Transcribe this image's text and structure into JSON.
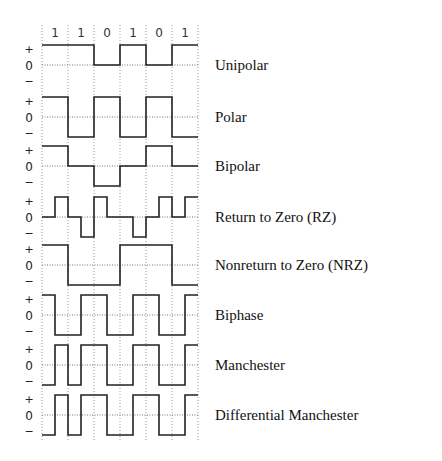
{
  "bits": [
    "1",
    "1",
    "0",
    "1",
    "0",
    "1"
  ],
  "axis_symbols": {
    "plus": "+",
    "zero": "0",
    "minus": "−"
  },
  "colors": {
    "wave": "#222222",
    "grid": "#9a9a9a",
    "text": "#111111"
  },
  "encodings": [
    {
      "name": "Unipolar",
      "half_bit_levels": [
        1,
        1,
        1,
        1,
        0,
        0,
        1,
        1,
        0,
        0,
        1,
        1
      ]
    },
    {
      "name": "Polar",
      "half_bit_levels": [
        1,
        1,
        -1,
        -1,
        1,
        1,
        -1,
        -1,
        1,
        1,
        -1,
        -1
      ]
    },
    {
      "name": "Bipolar",
      "half_bit_levels": [
        1,
        1,
        0,
        0,
        -1,
        -1,
        0,
        0,
        1,
        1,
        0,
        0
      ]
    },
    {
      "name": "Return to Zero (RZ)",
      "half_bit_levels": [
        0,
        1,
        0,
        -1,
        1,
        0,
        0,
        -1,
        0,
        1,
        0,
        1
      ]
    },
    {
      "name": "Nonreturn to Zero (NRZ)",
      "half_bit_levels": [
        1,
        1,
        -1,
        -1,
        -1,
        -1,
        1,
        1,
        1,
        1,
        -1,
        -1
      ]
    },
    {
      "name": "Biphase",
      "half_bit_levels": [
        1,
        -1,
        -1,
        1,
        1,
        -1,
        -1,
        1,
        1,
        -1,
        -1,
        1
      ]
    },
    {
      "name": "Manchester",
      "half_bit_levels": [
        -1,
        1,
        -1,
        1,
        1,
        -1,
        -1,
        1,
        1,
        -1,
        -1,
        1
      ]
    },
    {
      "name": "Differential Manchester",
      "half_bit_levels": [
        -1,
        1,
        -1,
        1,
        1,
        -1,
        -1,
        1,
        1,
        -1,
        -1,
        1
      ]
    }
  ]
}
